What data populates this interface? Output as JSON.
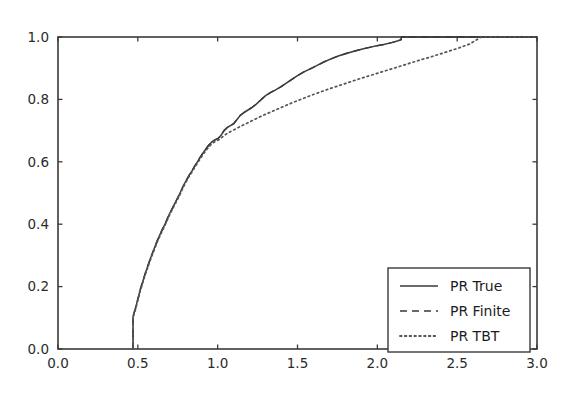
{
  "chart_data": {
    "type": "line",
    "title": "",
    "subtitle": "",
    "xlabel": "",
    "ylabel": "",
    "xlim": [
      0.0,
      3.0
    ],
    "ylim": [
      0.0,
      1.0
    ],
    "grid": false,
    "legend_position": "lower right",
    "xticks": [
      0.0,
      0.5,
      1.0,
      1.5,
      2.0,
      2.5,
      3.0
    ],
    "xtick_labels": [
      "0.0",
      "0.5",
      "1.0",
      "1.5",
      "2.0",
      "2.5",
      "3.0"
    ],
    "yticks": [
      0.0,
      0.2,
      0.4,
      0.6,
      0.8,
      1.0
    ],
    "ytick_labels": [
      "0.0",
      "0.2",
      "0.4",
      "0.6",
      "0.8",
      "1.0"
    ],
    "series": [
      {
        "name": "PR True",
        "style": "solid",
        "color": "#3a3a3a",
        "x": [
          0.47,
          0.47,
          0.485,
          0.5,
          0.515,
          0.53,
          0.545,
          0.56,
          0.575,
          0.59,
          0.605,
          0.62,
          0.64,
          0.655,
          0.67,
          0.685,
          0.7,
          0.715,
          0.73,
          0.745,
          0.76,
          0.775,
          0.79,
          0.805,
          0.82,
          0.84,
          0.855,
          0.87,
          0.885,
          0.9,
          0.915,
          0.93,
          0.945,
          0.96,
          0.975,
          0.99,
          1.005,
          1.02,
          1.04,
          1.06,
          1.08,
          1.1,
          1.12,
          1.14,
          1.165,
          1.19,
          1.215,
          1.24,
          1.27,
          1.3,
          1.33,
          1.36,
          1.395,
          1.43,
          1.465,
          1.5,
          1.54,
          1.58,
          1.62,
          1.665,
          1.71,
          1.76,
          1.81,
          1.865,
          1.92,
          1.98,
          2.04,
          2.09,
          2.13,
          2.15,
          2.15,
          3.0
        ],
        "y": [
          0.0,
          0.105,
          0.13,
          0.16,
          0.19,
          0.215,
          0.24,
          0.262,
          0.285,
          0.305,
          0.325,
          0.345,
          0.368,
          0.385,
          0.4,
          0.418,
          0.435,
          0.45,
          0.465,
          0.48,
          0.495,
          0.512,
          0.528,
          0.542,
          0.556,
          0.572,
          0.585,
          0.597,
          0.61,
          0.622,
          0.633,
          0.644,
          0.654,
          0.662,
          0.668,
          0.672,
          0.676,
          0.684,
          0.7,
          0.71,
          0.716,
          0.722,
          0.735,
          0.748,
          0.758,
          0.766,
          0.774,
          0.784,
          0.798,
          0.812,
          0.822,
          0.83,
          0.84,
          0.852,
          0.864,
          0.876,
          0.888,
          0.898,
          0.908,
          0.92,
          0.93,
          0.94,
          0.948,
          0.956,
          0.963,
          0.97,
          0.976,
          0.982,
          0.988,
          0.992,
          1.0,
          1.0
        ]
      },
      {
        "name": "PR Finite",
        "style": "dashed",
        "color": "#3a3a3a",
        "x": [
          0.47,
          0.47,
          0.485,
          0.5,
          0.515,
          0.53,
          0.545,
          0.56,
          0.575,
          0.59,
          0.605,
          0.62,
          0.64,
          0.655,
          0.67,
          0.685,
          0.7,
          0.715,
          0.73,
          0.745,
          0.76,
          0.775,
          0.79,
          0.805,
          0.82,
          0.84,
          0.855,
          0.87,
          0.885,
          0.9,
          0.915,
          0.93,
          0.945,
          0.96,
          0.975,
          0.99,
          1.005,
          1.02,
          1.04,
          1.06,
          1.08,
          1.1,
          1.12,
          1.14,
          1.165,
          1.19,
          1.215,
          1.24,
          1.27,
          1.3,
          1.33,
          1.36,
          1.395,
          1.43,
          1.465,
          1.5,
          1.54,
          1.58,
          1.62,
          1.665,
          1.71,
          1.76,
          1.81,
          1.865,
          1.92,
          1.98,
          2.04,
          2.09,
          2.13,
          2.15,
          2.15,
          3.0
        ],
        "y": [
          0.0,
          0.105,
          0.13,
          0.16,
          0.19,
          0.215,
          0.24,
          0.262,
          0.285,
          0.305,
          0.325,
          0.345,
          0.368,
          0.385,
          0.4,
          0.418,
          0.435,
          0.45,
          0.465,
          0.48,
          0.495,
          0.512,
          0.528,
          0.542,
          0.556,
          0.572,
          0.585,
          0.597,
          0.61,
          0.622,
          0.633,
          0.644,
          0.654,
          0.662,
          0.668,
          0.672,
          0.676,
          0.684,
          0.7,
          0.71,
          0.716,
          0.722,
          0.735,
          0.748,
          0.758,
          0.766,
          0.774,
          0.784,
          0.798,
          0.812,
          0.822,
          0.83,
          0.84,
          0.852,
          0.864,
          0.876,
          0.888,
          0.898,
          0.908,
          0.92,
          0.93,
          0.94,
          0.948,
          0.956,
          0.963,
          0.97,
          0.976,
          0.982,
          0.988,
          0.992,
          1.0,
          1.0
        ]
      },
      {
        "name": "PR TBT",
        "style": "dotted",
        "color": "#555555",
        "x": [
          0.47,
          0.47,
          0.485,
          0.5,
          0.515,
          0.53,
          0.545,
          0.56,
          0.575,
          0.59,
          0.605,
          0.62,
          0.64,
          0.655,
          0.67,
          0.685,
          0.7,
          0.715,
          0.73,
          0.745,
          0.76,
          0.775,
          0.79,
          0.805,
          0.82,
          0.84,
          0.855,
          0.87,
          0.885,
          0.9,
          0.915,
          0.93,
          0.945,
          0.96,
          0.975,
          0.99,
          1.005,
          1.02,
          1.045,
          1.07,
          1.1,
          1.13,
          1.165,
          1.2,
          1.24,
          1.285,
          1.33,
          1.375,
          1.425,
          1.475,
          1.53,
          1.585,
          1.645,
          1.705,
          1.77,
          1.835,
          1.9,
          1.97,
          2.04,
          2.11,
          2.185,
          2.26,
          2.34,
          2.42,
          2.5,
          2.58,
          2.65,
          2.65,
          3.0
        ],
        "y": [
          0.0,
          0.1,
          0.126,
          0.156,
          0.186,
          0.211,
          0.236,
          0.258,
          0.281,
          0.301,
          0.321,
          0.341,
          0.364,
          0.381,
          0.396,
          0.414,
          0.431,
          0.446,
          0.461,
          0.476,
          0.491,
          0.508,
          0.524,
          0.538,
          0.552,
          0.568,
          0.581,
          0.593,
          0.605,
          0.617,
          0.628,
          0.638,
          0.648,
          0.656,
          0.662,
          0.666,
          0.67,
          0.676,
          0.686,
          0.694,
          0.702,
          0.71,
          0.719,
          0.728,
          0.738,
          0.749,
          0.759,
          0.769,
          0.78,
          0.791,
          0.802,
          0.813,
          0.824,
          0.835,
          0.846,
          0.857,
          0.868,
          0.879,
          0.89,
          0.901,
          0.913,
          0.925,
          0.937,
          0.95,
          0.963,
          0.978,
          1.0,
          1.0,
          1.0
        ]
      }
    ]
  },
  "legend": {
    "entries": [
      {
        "label": "PR True",
        "style": "solid"
      },
      {
        "label": "PR Finite",
        "style": "dashed"
      },
      {
        "label": "PR TBT",
        "style": "dotted"
      }
    ]
  },
  "colors": {
    "axis": "#3a3a3a",
    "line": "#3a3a3a",
    "dotted": "#555555",
    "text": "#2b2b2b",
    "background": "#ffffff",
    "legend_border": "#3a3a3a"
  }
}
